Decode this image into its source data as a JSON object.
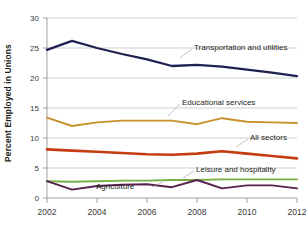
{
  "chart_data": {
    "type": "line",
    "title": "",
    "subtitle": "",
    "xlabel": "",
    "ylabel": "Percent Employed in Unions",
    "x": [
      2002,
      2003,
      2004,
      2005,
      2006,
      2007,
      2008,
      2009,
      2010,
      2011,
      2012
    ],
    "xlim": [
      2002,
      2012
    ],
    "ylim": [
      0,
      30
    ],
    "yticks": [
      0,
      5,
      10,
      15,
      20,
      25,
      30
    ],
    "ytick_labels": [
      "0",
      "5",
      "10",
      "15",
      "20",
      "25",
      "30"
    ],
    "xticks": [
      2002,
      2004,
      2006,
      2008,
      2010,
      2012
    ],
    "xtick_labels": [
      "2002",
      "2004",
      "2006",
      "2008",
      "2010",
      "2012"
    ],
    "grid": "horizontal",
    "legend_position": "inline-annotations",
    "series": [
      {
        "name": "Transportation and utilities",
        "color": "#1f2150",
        "values": [
          24.7,
          26.2,
          25.0,
          24.0,
          23.1,
          22.0,
          22.2,
          21.9,
          21.4,
          20.9,
          20.3
        ]
      },
      {
        "name": "Educational services",
        "color": "#c8922a",
        "values": [
          13.4,
          12.0,
          12.6,
          12.9,
          12.9,
          12.9,
          12.3,
          13.3,
          12.7,
          12.6,
          12.5
        ]
      },
      {
        "name": "All sectors",
        "color": "#c63c12",
        "values": [
          8.1,
          7.9,
          7.7,
          7.5,
          7.3,
          7.2,
          7.4,
          7.8,
          7.4,
          7.0,
          6.6
        ]
      },
      {
        "name": "Leisure and hospitality",
        "color": "#76b043",
        "values": [
          2.8,
          2.7,
          2.8,
          2.9,
          2.9,
          3.0,
          3.0,
          3.1,
          3.1,
          3.1,
          3.1
        ]
      },
      {
        "name": "Agriculture",
        "color": "#5a2050",
        "values": [
          2.8,
          1.4,
          2.0,
          2.2,
          2.3,
          1.8,
          3.0,
          1.6,
          2.1,
          2.1,
          1.6
        ]
      }
    ],
    "annotations": [
      {
        "text": "Transportation and utilities",
        "color": "#231f20"
      },
      {
        "text": "Educational services",
        "color": "#231f20"
      },
      {
        "text": "All sectors",
        "color": "#231f20"
      },
      {
        "text": "Leisure and hospitality",
        "color": "#231f20"
      },
      {
        "text": "Agriculture",
        "color": "#231f20"
      }
    ]
  }
}
